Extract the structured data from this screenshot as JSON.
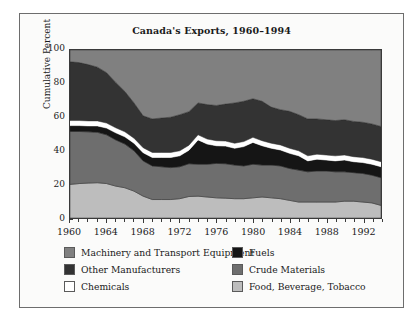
{
  "chart_data": {
    "type": "area",
    "title": "Canada's Exports, 1960–1994",
    "xlabel": "",
    "ylabel": "Cumulative Percent",
    "ylim": [
      0,
      100
    ],
    "xlim": [
      1960,
      1994
    ],
    "grid": false,
    "stacked": true,
    "legend_position": "bottom",
    "yticks": [
      100,
      80,
      60,
      40,
      20,
      0
    ],
    "xticks": [
      1960,
      1964,
      1968,
      1972,
      1976,
      1980,
      1984,
      1988,
      1992
    ],
    "x": [
      1960,
      1961,
      1962,
      1963,
      1964,
      1965,
      1966,
      1967,
      1968,
      1969,
      1970,
      1971,
      1972,
      1973,
      1974,
      1975,
      1976,
      1977,
      1978,
      1979,
      1980,
      1981,
      1982,
      1983,
      1984,
      1985,
      1986,
      1987,
      1988,
      1989,
      1990,
      1991,
      1992,
      1993,
      1994
    ],
    "series": [
      {
        "name": "Food, Beverage, Tobacco",
        "color": "#bdbdbd",
        "order": 1,
        "values": [
          20.0,
          20.5,
          20.8,
          21.0,
          20.5,
          19.0,
          18.0,
          16.0,
          13.0,
          11.0,
          11.0,
          11.0,
          11.5,
          12.8,
          13.0,
          12.5,
          12.0,
          11.8,
          11.5,
          11.5,
          12.0,
          12.5,
          12.0,
          11.5,
          10.5,
          9.5,
          9.5,
          9.5,
          9.5,
          9.5,
          10.0,
          10.0,
          9.5,
          9.0,
          7.5
        ]
      },
      {
        "name": "Crude Materials",
        "color": "#6e6e6e",
        "order": 2,
        "values": [
          31.5,
          31.0,
          30.5,
          30.0,
          29.0,
          27.5,
          26.0,
          24.0,
          21.0,
          20.0,
          19.5,
          19.0,
          19.0,
          19.5,
          19.0,
          19.5,
          20.5,
          20.5,
          20.0,
          19.5,
          20.0,
          19.0,
          19.5,
          19.5,
          19.0,
          19.0,
          18.0,
          18.5,
          18.5,
          18.0,
          17.5,
          17.0,
          17.0,
          16.5,
          16.5
        ]
      },
      {
        "name": "Fuels",
        "color": "#151515",
        "order": 3,
        "values": [
          3.5,
          3.5,
          3.5,
          3.8,
          4.0,
          4.2,
          4.3,
          4.5,
          4.8,
          5.0,
          5.5,
          6.0,
          6.5,
          8.0,
          14.5,
          12.0,
          10.5,
          10.5,
          10.0,
          11.5,
          13.0,
          11.5,
          10.0,
          9.5,
          9.0,
          8.5,
          6.5,
          7.0,
          6.5,
          6.5,
          7.0,
          6.5,
          6.5,
          6.5,
          6.5
        ]
      },
      {
        "name": "Chemicals",
        "color": "#ffffff",
        "order": 4,
        "values": [
          3.0,
          3.0,
          3.0,
          3.0,
          3.0,
          3.0,
          3.0,
          3.0,
          3.0,
          3.0,
          3.0,
          3.0,
          3.0,
          3.0,
          3.0,
          3.0,
          3.0,
          3.0,
          3.0,
          3.0,
          3.0,
          3.0,
          3.0,
          3.0,
          3.0,
          3.0,
          3.0,
          3.0,
          3.0,
          3.0,
          3.0,
          3.0,
          3.0,
          3.0,
          3.0
        ]
      },
      {
        "name": "Other Manufacturers",
        "color": "#333333",
        "order": 5,
        "values": [
          35.0,
          34.5,
          33.5,
          32.0,
          30.0,
          27.0,
          24.0,
          21.0,
          19.0,
          20.0,
          20.5,
          21.0,
          21.5,
          20.0,
          19.0,
          20.5,
          21.0,
          22.0,
          24.0,
          24.0,
          23.0,
          23.5,
          21.5,
          21.0,
          22.0,
          21.5,
          22.0,
          21.0,
          21.0,
          21.0,
          21.0,
          21.0,
          21.0,
          21.0,
          21.0
        ]
      },
      {
        "name": "Machinery and Transport Equipment",
        "color": "#808080",
        "order": 6,
        "values": [
          7.0,
          7.5,
          8.7,
          10.2,
          13.5,
          19.3,
          24.7,
          31.5,
          39.2,
          41.0,
          40.5,
          40.0,
          38.5,
          36.7,
          31.5,
          32.5,
          33.0,
          32.2,
          31.5,
          30.5,
          29.0,
          30.5,
          34.0,
          35.5,
          36.5,
          38.5,
          41.0,
          41.0,
          41.5,
          42.0,
          41.5,
          42.5,
          43.0,
          44.0,
          45.5
        ]
      }
    ],
    "legend_entries": [
      {
        "label": "Machinery and Transport Equipment",
        "color": "#808080"
      },
      {
        "label": "Fuels",
        "color": "#151515"
      },
      {
        "label": "Other Manufacturers",
        "color": "#333333"
      },
      {
        "label": "Crude Materials",
        "color": "#6e6e6e"
      },
      {
        "label": "Chemicals",
        "color": "#ffffff"
      },
      {
        "label": "Food, Beverage, Tobacco",
        "color": "#bdbdbd"
      }
    ]
  }
}
